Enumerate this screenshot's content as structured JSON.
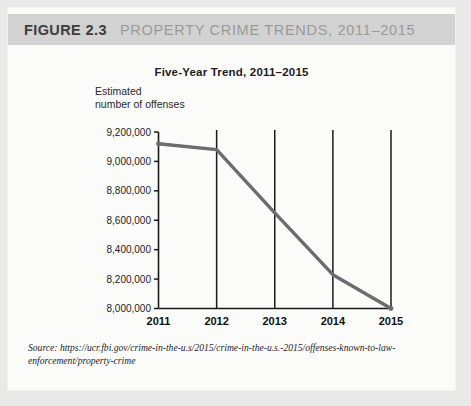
{
  "header": {
    "figure_number": "FIGURE 2.3",
    "figure_title": "PROPERTY CRIME TRENDS, 2011–2015"
  },
  "source": {
    "text": "Source: https://ucr.fbi.gov/crime-in-the-u.s/2015/crime-in-the-u.s.-2015/offenses-known-to-law-enforcement/property-crime"
  },
  "colors": {
    "header_band": "#d2d2d2",
    "card_background": "#fbfbfa",
    "page_background": "#e9e9e9",
    "series_line": "#6b6b70",
    "axis": "#1a1a1a",
    "gridline": "#1a1a1a"
  },
  "chart_data": {
    "type": "line",
    "title": "Five-Year Trend, 2011–2015",
    "xlabel": "",
    "ylabel": "Estimated number of offenses",
    "ylabel_line1": "Estimated",
    "ylabel_line2": "number of offenses",
    "categories": [
      "2011",
      "2012",
      "2013",
      "2014",
      "2015"
    ],
    "values": [
      9120000,
      9080000,
      8650000,
      8230000,
      8000000
    ],
    "series": [
      {
        "name": "Estimated number of offenses",
        "values": [
          9120000,
          9080000,
          8650000,
          8230000,
          8000000
        ]
      }
    ],
    "ylim": [
      8000000,
      9200000
    ],
    "ytick_values": [
      8000000,
      8200000,
      8400000,
      8600000,
      8800000,
      9000000,
      9200000
    ],
    "ytick_labels": [
      "8,000,000",
      "8,200,000",
      "8,400,000",
      "8,600,000",
      "8,800,000",
      "9,000,000",
      "9,200,000"
    ],
    "xtick_labels": [
      "2011",
      "2012",
      "2013",
      "2014",
      "2015"
    ],
    "grid": "vertical-only",
    "legend": "none"
  }
}
